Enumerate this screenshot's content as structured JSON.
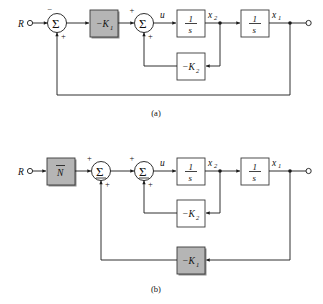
{
  "figure": {
    "kind": "control-system-block-diagram",
    "background_color": "#ffffff",
    "line_color": "#1a1a1a",
    "shaded_block_color": "#b5b5b5",
    "unshaded_block_color": "#ffffff",
    "captions": {
      "part_a": "(a)",
      "part_b": "(b)"
    }
  },
  "diagram_a": {
    "caption": "(a)",
    "input_label": "R",
    "output_terminal_icon": "open-circle-terminal",
    "summer_1": {
      "symbol": "Σ",
      "sign_top_input": "−",
      "sign_bottom_input": "+"
    },
    "summer_2": {
      "symbol": "Σ",
      "sign_left_input": "+",
      "sign_bottom_input": "+"
    },
    "gain_block": {
      "label": "−K",
      "subscript": "1",
      "shaded": "true"
    },
    "feedback_block": {
      "label": "−K",
      "subscript": "2",
      "shaded": "false"
    },
    "integrator_1": {
      "numerator": "1",
      "denominator": "s"
    },
    "integrator_2": {
      "numerator": "1",
      "denominator": "s"
    },
    "signal_labels": {
      "control": "u",
      "state_2": "x",
      "state_2_sub": "2",
      "state_1": "x",
      "state_1_sub": "1"
    }
  },
  "diagram_b": {
    "caption": "(b)",
    "input_label": "R",
    "output_terminal_icon": "open-circle-terminal",
    "feedforward_block": {
      "label": "N",
      "has_overbar": "true",
      "shaded": "true"
    },
    "summer_1": {
      "symbol": "Σ",
      "sign_top_input": "+",
      "sign_bottom_input": "+"
    },
    "summer_2": {
      "symbol": "Σ",
      "sign_left_input": "+",
      "sign_bottom_input": "+"
    },
    "inner_feedback_block": {
      "label": "−K",
      "subscript": "2",
      "shaded": "false"
    },
    "outer_feedback_block": {
      "label": "−K",
      "subscript": "1",
      "shaded": "true"
    },
    "integrator_1": {
      "numerator": "1",
      "denominator": "s"
    },
    "integrator_2": {
      "numerator": "1",
      "denominator": "s"
    },
    "signal_labels": {
      "control": "u",
      "state_2": "x",
      "state_2_sub": "2",
      "state_1": "x",
      "state_1_sub": "1"
    }
  }
}
